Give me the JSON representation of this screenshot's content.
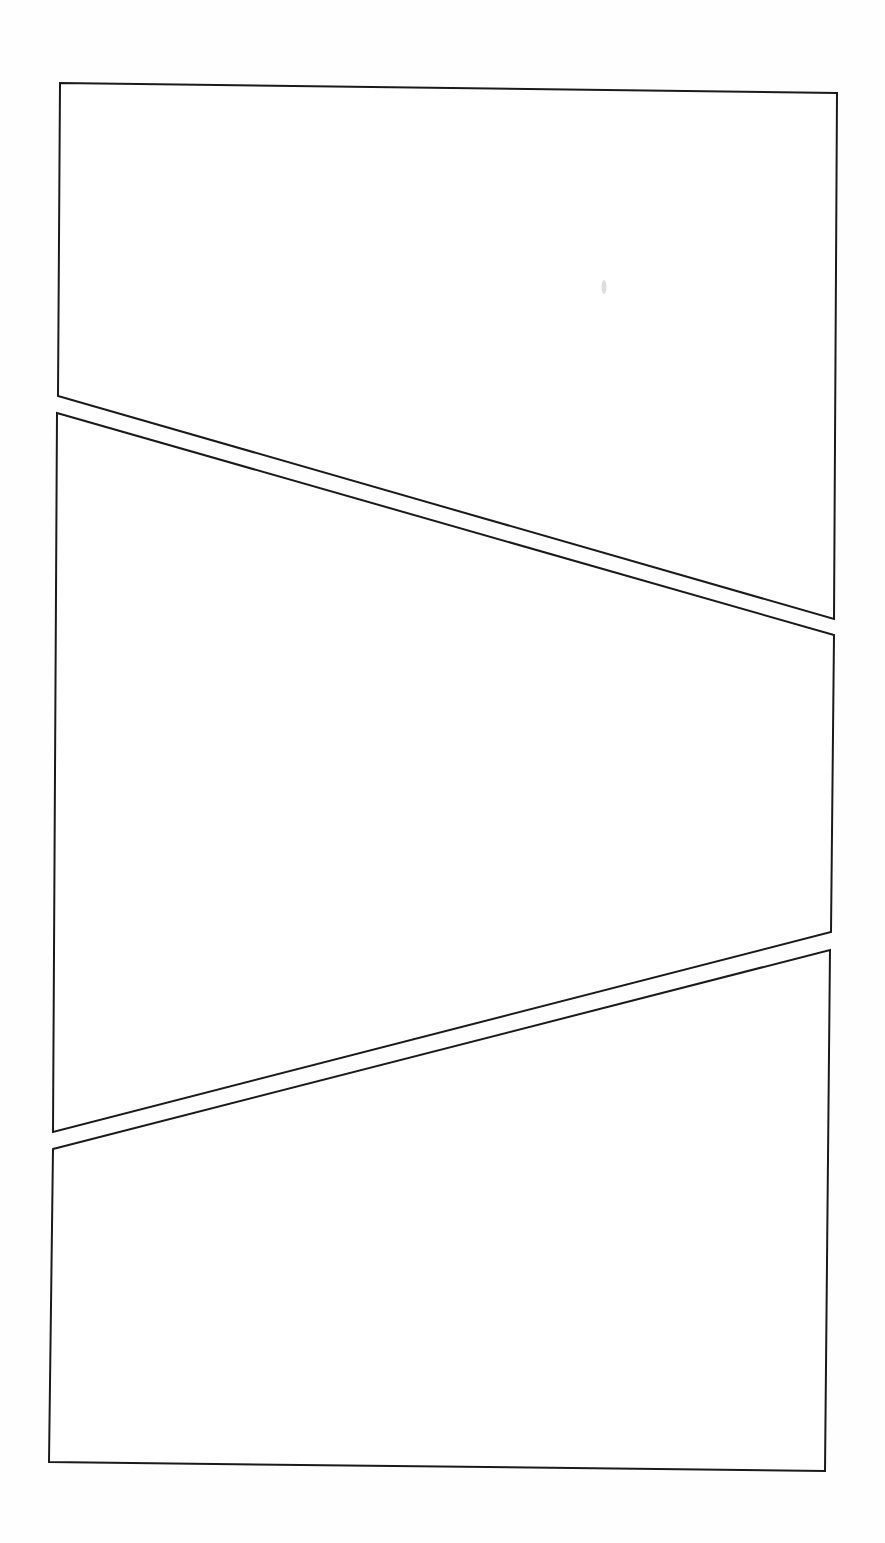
{
  "page": {
    "type": "blank comic page layout",
    "width": 885,
    "height": 1543,
    "background": "#ffffff",
    "border_color": "#1a1a1a",
    "panel_count": 3
  },
  "panels": [
    {
      "id": "panel-1",
      "points": "60,83 837,93 834,619 58,396",
      "content": ""
    },
    {
      "id": "panel-2",
      "points": "57,413 834,635 831,932 53,1132",
      "content": ""
    },
    {
      "id": "panel-3",
      "points": "53,1149 830,950 825,1471 49,1462",
      "content": ""
    }
  ]
}
